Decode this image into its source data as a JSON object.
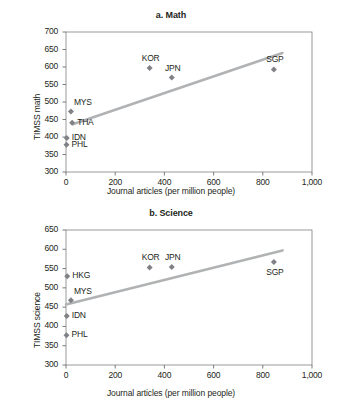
{
  "figure": {
    "background": "#ffffff",
    "marker_color": "#808285",
    "trendline_color": "#b0b2b4",
    "axis_color": "#6d6e71",
    "text_color": "#231f20"
  },
  "chart_data": [
    {
      "type": "scatter",
      "id": "math",
      "title": "a. Math",
      "xlabel": "Journal articles (per million people)",
      "ylabel": "TIMSS math",
      "xlim": [
        0,
        1000
      ],
      "ylim": [
        300,
        700
      ],
      "xticks": [
        0,
        200,
        400,
        600,
        800,
        1000
      ],
      "xtick_labels": [
        "0",
        "200",
        "400",
        "600",
        "800",
        "1,000"
      ],
      "yticks": [
        300,
        350,
        400,
        450,
        500,
        550,
        600,
        650,
        700
      ],
      "ytick_labels": [
        "300",
        "350",
        "400",
        "450",
        "500",
        "550",
        "600",
        "650",
        "700"
      ],
      "grid": false,
      "legend": "none",
      "points": [
        {
          "label": "MYS",
          "x": 20,
          "y": 473,
          "label_pos": "above-right"
        },
        {
          "label": "THA",
          "x": 25,
          "y": 441,
          "label_pos": "right"
        },
        {
          "label": "IDN",
          "x": 3,
          "y": 397,
          "label_pos": "right"
        },
        {
          "label": "PHL",
          "x": 2,
          "y": 378,
          "label_pos": "right"
        },
        {
          "label": "KOR",
          "x": 340,
          "y": 597,
          "label_pos": "above"
        },
        {
          "label": "JPN",
          "x": 430,
          "y": 570,
          "label_pos": "above"
        },
        {
          "label": "SGP",
          "x": 845,
          "y": 593,
          "label_pos": "above"
        }
      ],
      "trendline": {
        "x0": 30,
        "y0": 437,
        "x1": 880,
        "y1": 640
      }
    },
    {
      "type": "scatter",
      "id": "science",
      "title": "b. Science",
      "xlabel": "Journal articles (per million people)",
      "ylabel": "TIMSS science",
      "xlim": [
        0,
        1000
      ],
      "ylim": [
        300,
        650
      ],
      "xticks": [
        0,
        200,
        400,
        600,
        800,
        1000
      ],
      "xtick_labels": [
        "0",
        "200",
        "400",
        "600",
        "800",
        "1,000"
      ],
      "yticks": [
        300,
        350,
        400,
        450,
        500,
        550,
        600,
        650
      ],
      "ytick_labels": [
        "300",
        "350",
        "400",
        "450",
        "500",
        "550",
        "600",
        "650"
      ],
      "grid": false,
      "legend": "none",
      "points": [
        {
          "label": "HKG",
          "x": 5,
          "y": 530,
          "label_pos": "right"
        },
        {
          "label": "MYS",
          "x": 20,
          "y": 468,
          "label_pos": "above-right"
        },
        {
          "label": "IDN",
          "x": 3,
          "y": 427,
          "label_pos": "right"
        },
        {
          "label": "PHL",
          "x": 2,
          "y": 377,
          "label_pos": "right"
        },
        {
          "label": "KOR",
          "x": 340,
          "y": 553,
          "label_pos": "above"
        },
        {
          "label": "JPN",
          "x": 430,
          "y": 554,
          "label_pos": "above"
        },
        {
          "label": "SGP",
          "x": 845,
          "y": 567,
          "label_pos": "below"
        }
      ],
      "trendline": {
        "x0": 0,
        "y0": 457,
        "x1": 880,
        "y1": 597
      }
    }
  ]
}
